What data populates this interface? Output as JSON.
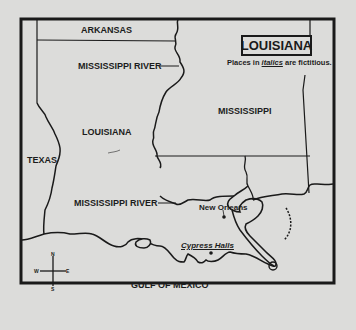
{
  "map": {
    "title": "LOUISIANA",
    "subtitle_prefix": "Places in ",
    "subtitle_italic": "italics",
    "subtitle_suffix": " are fictitious.",
    "states": {
      "arkansas": "ARKANSAS",
      "louisiana": "LOUISIANA",
      "mississippi": "MISSISSIPPI",
      "texas": "TEXAS"
    },
    "rivers": {
      "mississippi_north": "MISSISSIPPI RIVER",
      "mississippi_south": "MISSISSIPPI RIVER"
    },
    "water": {
      "gulf": "GULF OF MEXICO"
    },
    "cities": [
      {
        "name": "New Orleans",
        "fictitious": false
      },
      {
        "name": "Cypress Halls",
        "fictitious": true
      }
    ],
    "compass": {
      "n": "N",
      "s": "S",
      "e": "E",
      "w": "W"
    },
    "colors": {
      "background": "#dcdcda",
      "ink": "#1a1a1a"
    }
  }
}
